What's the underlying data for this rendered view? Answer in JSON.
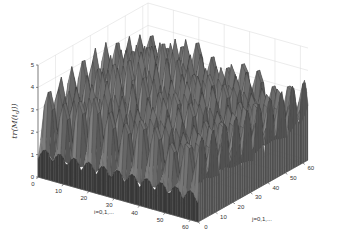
{
  "chart_data": {
    "type": "surface3d",
    "title": "",
    "xlabel": "i=0,1,...",
    "ylabel": "j=0,1,...",
    "zlabel": "tr(M(i,j))",
    "x_ticks": [
      "0",
      "10",
      "20",
      "30",
      "40",
      "50",
      "60"
    ],
    "y_ticks": [
      "0",
      "10",
      "20",
      "30",
      "40",
      "50",
      "60"
    ],
    "z_ticks": [
      "0",
      "1",
      "2",
      "3",
      "4",
      "5"
    ],
    "xlim": [
      0,
      63
    ],
    "ylim": [
      0,
      63
    ],
    "zlim": [
      0,
      5
    ],
    "grid": true,
    "colormap": "gray",
    "surface_description": "Oscillating ridged surface over i,j in 0..63; values mostly between ~0.8 and ~4.8, with periodic peaks along both axes and a flat dark base edge near j=0 around z≈0.8-1.5",
    "sample_profile_j0": [
      0.8,
      1.5,
      1.0,
      1.6,
      1.0,
      1.6,
      1.1,
      1.7,
      1.0,
      1.6,
      1.1,
      1.5,
      1.0
    ],
    "peak_value": 4.8,
    "typical_range": [
      1.0,
      4.0
    ]
  }
}
